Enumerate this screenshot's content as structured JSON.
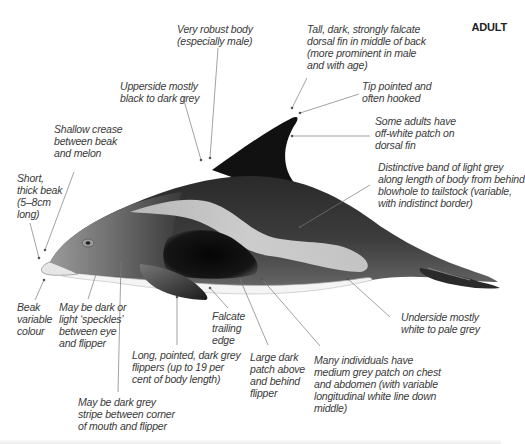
{
  "title": "ADULT",
  "labels": {
    "robust_body": "Very robust body\n(especially male)",
    "dorsal_fin": "Tall, dark, strongly falcate\ndorsal fin in middle of back\n(more prominent in male\nand with age)",
    "tip": "Tip pointed and\noften hooked",
    "upperside": "Upperside mostly\nblack to dark grey",
    "off_white_patch": "Some adults have\noff-white patch on\ndorsal fin",
    "crease": "Shallow crease\nbetween beak\nand melon",
    "beak": "Short,\nthick beak\n(5–8cm\nlong)",
    "light_band": "Distinctive band of light grey\nalong length of body from behind\nblowhole to tailstock (variable,\nwith indistinct border)",
    "beak_colour": "Beak\nvariable\ncolour",
    "speckles": "May be dark or\nlight ‘speckles’\nbetween eye\nand flipper",
    "falcate_edge": "Falcate\ntrailing\nedge",
    "flippers": "Long, pointed, dark grey\nflippers (up to 19 per\ncent of body length)",
    "dark_patch": "Large dark\npatch above\nand behind\nflipper",
    "grey_patch": "Many individuals have\nmedium grey patch on chest\nand abdomen (with variable\nlongitudinal white line down\nmiddle)",
    "underside": "Underside mostly\nwhite to pale grey",
    "stripe": "May be dark grey\nstripe between corner\nof mouth and flipper"
  },
  "colors": {
    "text": "#3a3a3a",
    "leader": "#7a7a7a",
    "body_dark": "#141414",
    "body_mid": "#5a5a5a",
    "band_light": "#c8c8c8",
    "belly": "#f2f2f2"
  }
}
